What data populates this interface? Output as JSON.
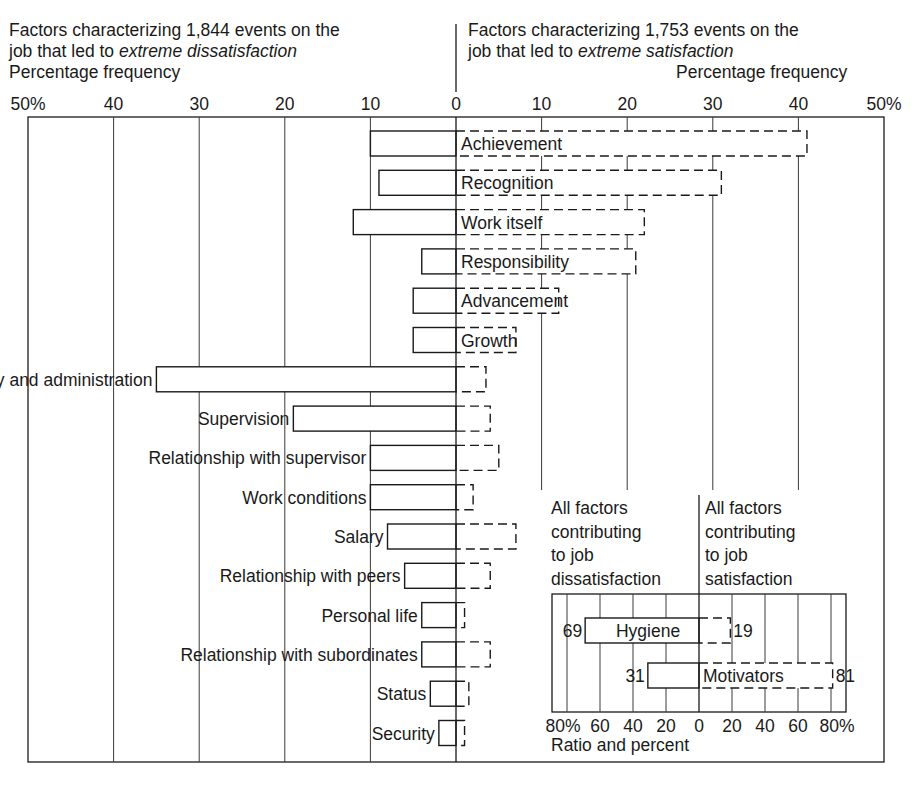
{
  "headers": {
    "left": {
      "line1": "Factors characterizing 1,844 events on the",
      "line2_prefix": "job that led to ",
      "line2_emphasis": "extreme dissatisfaction",
      "axis_label": "Percentage frequency"
    },
    "right": {
      "line1": "Factors characterizing 1,753 events on the",
      "line2_prefix": "job that led to ",
      "line2_emphasis": "extreme  satisfaction",
      "axis_label": "Percentage frequency"
    }
  },
  "colors": {
    "ink": "#1a1a1a",
    "grid": "#3a3a3a",
    "background": "#ffffff",
    "bar_fill": "#ffffff"
  },
  "chart_data": [
    {
      "type": "bar",
      "orientation": "horizontal-diverging",
      "title": "Factors affecting job attitudes",
      "left_title": "Factors characterizing 1,844 events on the job that led to extreme dissatisfaction",
      "right_title": "Factors characterizing 1,753 events on the job that led to extreme satisfaction",
      "xlabel_left": "Percentage frequency",
      "xlabel_right": "Percentage frequency",
      "left_ticks": [
        "50%",
        "40",
        "30",
        "20",
        "10",
        "0"
      ],
      "right_ticks": [
        "0",
        "10",
        "20",
        "30",
        "40",
        "50%"
      ],
      "xlim": [
        -50,
        50
      ],
      "grid": true,
      "legend": "solid outline = dissatisfaction (left), dashed outline = satisfaction (right)",
      "categories": [
        "Achievement",
        "Recognition",
        "Work itself",
        "Responsibility",
        "Advancement",
        "Growth",
        "Company policy and administration",
        "Supervision",
        "Relationship with supervisor",
        "Work conditions",
        "Salary",
        "Relationship with peers",
        "Personal life",
        "Relationship with subordinates",
        "Status",
        "Security"
      ],
      "label_side": [
        "right",
        "right",
        "right",
        "right",
        "right",
        "right",
        "left",
        "left",
        "left",
        "left",
        "left",
        "left",
        "left",
        "left",
        "left",
        "left"
      ],
      "series": [
        {
          "name": "Extreme dissatisfaction (%)",
          "style": "solid",
          "values": [
            10,
            9,
            12,
            4,
            5,
            5,
            35,
            19,
            10,
            10,
            8,
            6,
            4,
            4,
            3,
            2
          ]
        },
        {
          "name": "Extreme satisfaction (%)",
          "style": "dashed",
          "values": [
            41,
            31,
            22,
            21,
            12,
            7,
            3.5,
            4,
            5,
            2,
            7,
            4,
            1,
            4,
            1.5,
            1
          ]
        }
      ]
    },
    {
      "type": "bar",
      "orientation": "horizontal-diverging",
      "title": "All factors",
      "left_title": "All factors contributing to job dissatisfaction",
      "right_title": "All factors contributing to job satisfaction",
      "left_title_lines": [
        "All factors",
        "contributing",
        "to job",
        "dissatisfaction"
      ],
      "right_title_lines": [
        "All factors",
        "contributing",
        "to job",
        "satisfaction"
      ],
      "xlabel": "Ratio and percent",
      "ticks": [
        "80%",
        "60",
        "40",
        "20",
        "0",
        "20",
        "40",
        "60",
        "80%"
      ],
      "xlim": [
        -80,
        80
      ],
      "grid": true,
      "categories": [
        "Hygiene",
        "Motivators"
      ],
      "series": [
        {
          "name": "Job dissatisfaction",
          "style": "solid",
          "values": [
            69,
            31
          ]
        },
        {
          "name": "Job satisfaction",
          "style": "dashed",
          "values": [
            19,
            81
          ]
        }
      ],
      "data_labels": {
        "left": [
          "69",
          "31"
        ],
        "right": [
          "19",
          "81"
        ]
      }
    }
  ]
}
